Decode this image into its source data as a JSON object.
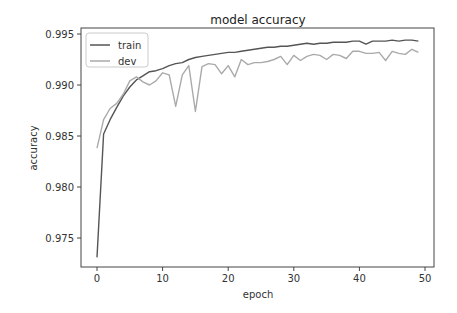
{
  "chart_data": {
    "type": "line",
    "title": "model accuracy",
    "xlabel": "epoch",
    "ylabel": "accuracy",
    "xlim": [
      -2.5,
      51.5
    ],
    "ylim": [
      0.9722,
      0.9953
    ],
    "xticks": [
      0,
      10,
      20,
      30,
      40,
      50
    ],
    "xtick_labels": [
      "0",
      "10",
      "20",
      "30",
      "40",
      "50"
    ],
    "yticks": [
      0.975,
      0.98,
      0.985,
      0.99,
      0.995
    ],
    "ytick_labels": [
      "0.975",
      "0.980",
      "0.985",
      "0.990",
      "0.995"
    ],
    "grid": false,
    "legend_position": "upper left",
    "x": [
      0,
      1,
      2,
      3,
      4,
      5,
      6,
      7,
      8,
      9,
      10,
      11,
      12,
      13,
      14,
      15,
      16,
      17,
      18,
      19,
      20,
      21,
      22,
      23,
      24,
      25,
      26,
      27,
      28,
      29,
      30,
      31,
      32,
      33,
      34,
      35,
      36,
      37,
      38,
      39,
      40,
      41,
      42,
      43,
      44,
      45,
      46,
      47,
      48,
      49
    ],
    "series": [
      {
        "name": "train",
        "color": "#555555",
        "values": [
          0.9731,
          0.9852,
          0.9866,
          0.9878,
          0.9889,
          0.9898,
          0.9905,
          0.9909,
          0.9913,
          0.9914,
          0.9916,
          0.9919,
          0.9921,
          0.9922,
          0.9925,
          0.9927,
          0.9928,
          0.9929,
          0.993,
          0.9931,
          0.9932,
          0.9932,
          0.9933,
          0.9934,
          0.9935,
          0.9936,
          0.9937,
          0.9937,
          0.9938,
          0.9938,
          0.9939,
          0.994,
          0.9941,
          0.994,
          0.9941,
          0.9941,
          0.9942,
          0.9942,
          0.9942,
          0.9943,
          0.9943,
          0.994,
          0.9943,
          0.9943,
          0.9943,
          0.9944,
          0.9943,
          0.9944,
          0.9944,
          0.9943
        ]
      },
      {
        "name": "dev",
        "color": "#aaaaaa",
        "values": [
          0.9838,
          0.9866,
          0.9877,
          0.9882,
          0.9891,
          0.9904,
          0.9908,
          0.9903,
          0.99,
          0.9904,
          0.9912,
          0.991,
          0.9879,
          0.991,
          0.9919,
          0.9874,
          0.9918,
          0.9921,
          0.992,
          0.9911,
          0.9919,
          0.9908,
          0.9925,
          0.992,
          0.9922,
          0.9922,
          0.9923,
          0.9925,
          0.9928,
          0.992,
          0.9929,
          0.9924,
          0.9928,
          0.993,
          0.9929,
          0.9925,
          0.993,
          0.9929,
          0.9926,
          0.9933,
          0.9933,
          0.9931,
          0.9931,
          0.9932,
          0.9924,
          0.9933,
          0.9931,
          0.993,
          0.9935,
          0.9932
        ]
      }
    ]
  }
}
